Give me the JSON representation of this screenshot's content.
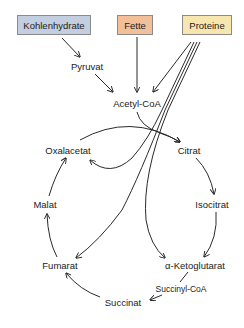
{
  "colors": {
    "kohlenhydrate_box": "#c3cfe0",
    "fette_box": "#f2bf99",
    "proteine_box": "#f7e6ad",
    "line": "#2a2a2a"
  },
  "sources": [
    {
      "id": "kohlenhydrate",
      "label": "Kohlenhydrate"
    },
    {
      "id": "fette",
      "label": "Fette"
    },
    {
      "id": "proteine",
      "label": "Proteine"
    }
  ],
  "intermediates": {
    "pyruvat": "Pyruvat",
    "acetyl_coa": "Acetyl-CoA"
  },
  "cycle": {
    "oxalacetat": "Oxalacetat",
    "citrat": "Citrat",
    "isocitrat": "Isocitrat",
    "alpha_ketoglutarat": "α-Ketoglutarat",
    "succinyl_coa": "Succinyl-CoA",
    "succinat": "Succinat",
    "fumarat": "Fumarat",
    "malat": "Malat"
  },
  "edges": [
    [
      "Kohlenhydrate",
      "Pyruvat"
    ],
    [
      "Pyruvat",
      "Acetyl-CoA"
    ],
    [
      "Fette",
      "Acetyl-CoA"
    ],
    [
      "Proteine",
      "Acetyl-CoA"
    ],
    [
      "Proteine",
      "Oxalacetat"
    ],
    [
      "Proteine",
      "Fumarat"
    ],
    [
      "Proteine",
      "α-Ketoglutarat"
    ],
    [
      "Acetyl-CoA",
      "Citrat"
    ],
    [
      "Oxalacetat",
      "Citrat"
    ],
    [
      "Citrat",
      "Isocitrat"
    ],
    [
      "Isocitrat",
      "α-Ketoglutarat"
    ],
    [
      "α-Ketoglutarat",
      "Succinyl-CoA"
    ],
    [
      "Succinyl-CoA",
      "Succinat"
    ],
    [
      "Succinat",
      "Fumarat"
    ],
    [
      "Fumarat",
      "Malat"
    ],
    [
      "Malat",
      "Oxalacetat"
    ]
  ]
}
